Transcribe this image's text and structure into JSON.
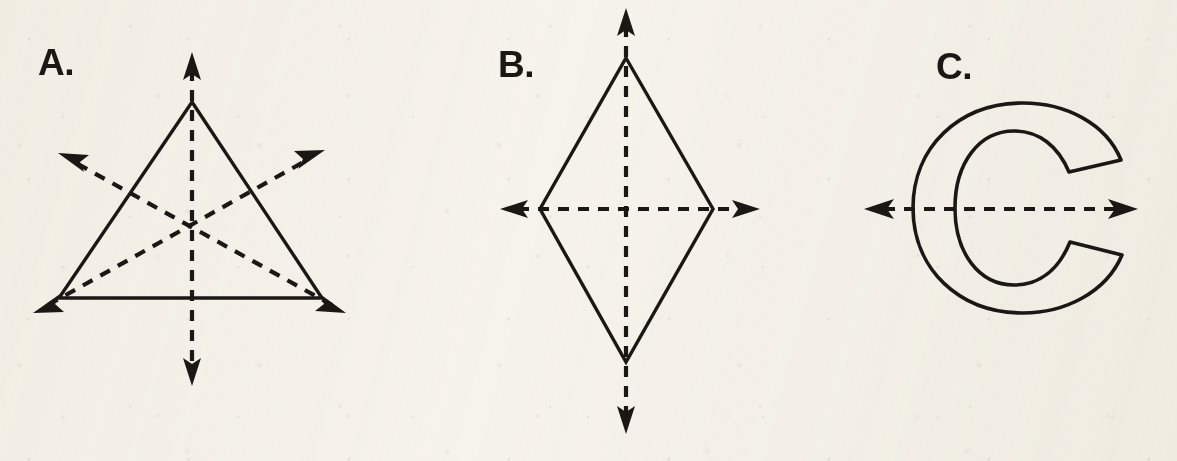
{
  "page": {
    "width": 1177,
    "height": 461,
    "background_color": "#f8f6f1",
    "ink_color": "#1b1714"
  },
  "panels": [
    {
      "id": "a",
      "label": "A.",
      "figure_name": "equilateral-triangle",
      "figure_kind": "triangle",
      "symmetry_line_count": 3,
      "symmetry_lines": [
        {
          "name": "vertical-symmetry-line",
          "orientation": "vertical"
        },
        {
          "name": "left-diagonal-symmetry-line",
          "orientation": "diagonal"
        },
        {
          "name": "right-diagonal-symmetry-line",
          "orientation": "diagonal"
        }
      ],
      "vertices": [
        {
          "name": "apex",
          "x": 192,
          "y": 102
        },
        {
          "name": "bottom-left",
          "x": 59,
          "y": 298
        },
        {
          "name": "bottom-right",
          "x": 322,
          "y": 298
        }
      ]
    },
    {
      "id": "b",
      "label": "B.",
      "figure_name": "kite-rhombus",
      "figure_kind": "kite",
      "symmetry_line_count": 2,
      "symmetry_lines": [
        {
          "name": "vertical-symmetry-line",
          "orientation": "vertical"
        },
        {
          "name": "horizontal-symmetry-line",
          "orientation": "horizontal"
        }
      ],
      "vertices": [
        {
          "name": "top",
          "x": 626,
          "y": 58
        },
        {
          "name": "right",
          "x": 713,
          "y": 209
        },
        {
          "name": "bottom",
          "x": 626,
          "y": 362
        },
        {
          "name": "left",
          "x": 540,
          "y": 209
        }
      ]
    },
    {
      "id": "c",
      "label": "C.",
      "figure_name": "letter-c-outline",
      "figure_kind": "letter",
      "letter": "C",
      "symmetry_line_count": 1,
      "symmetry_lines": [
        {
          "name": "horizontal-symmetry-line",
          "orientation": "horizontal"
        }
      ],
      "bounds": {
        "left": 913,
        "top": 115,
        "right": 1075,
        "bottom": 310
      }
    }
  ]
}
